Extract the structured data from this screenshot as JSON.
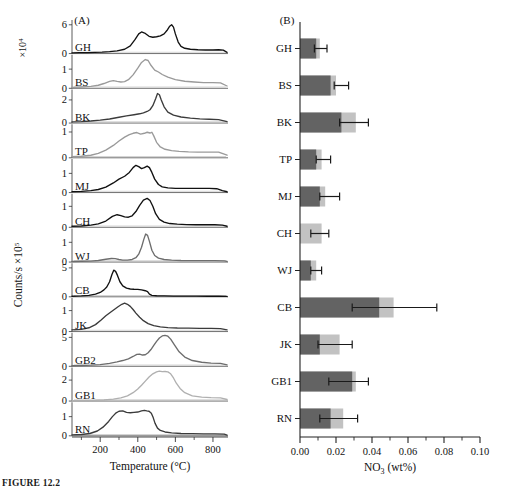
{
  "figure": {
    "caption": "FIGURE 12.2",
    "panel_a_label": "(A)",
    "panel_b_label": "(B)"
  },
  "chart_data": [
    {
      "type": "line",
      "title": "(A)",
      "xlabel": "Temperature (°C)",
      "ylabel": "Counts/s",
      "y_exponent_top": "×10",
      "y_exponent_top_sup": "4",
      "y_exponent_main": "×10",
      "y_exponent_main_sup": "5",
      "xlim": [
        50,
        880
      ],
      "xticks": [
        200,
        400,
        600,
        800
      ],
      "xtick_labels": [
        "200",
        "400",
        "600",
        "800"
      ],
      "xminor": [
        100,
        300,
        500,
        700
      ],
      "grid": false,
      "legend": "none",
      "note": "Twelve stacked thermal-evolution traces, one per sample; each sub-panel has its own y scale.",
      "series": [
        {
          "name": "GH",
          "color": "#121212",
          "ylim": [
            0,
            7
          ],
          "yticks": [
            0,
            6
          ],
          "ytick_labels": [
            "0",
            "6"
          ],
          "x": [
            50,
            90,
            130,
            170,
            210,
            250,
            290,
            330,
            360,
            385,
            405,
            420,
            440,
            460,
            480,
            500,
            520,
            540,
            555,
            570,
            580,
            590,
            600,
            615,
            630,
            650,
            680,
            720,
            760,
            800,
            830,
            855,
            875
          ],
          "y": [
            0.15,
            0.18,
            0.2,
            0.25,
            0.3,
            0.4,
            0.55,
            0.9,
            1.6,
            2.9,
            4.1,
            4.5,
            4.2,
            3.6,
            3.4,
            3.5,
            3.7,
            4.1,
            4.8,
            5.7,
            6.0,
            5.5,
            4.1,
            2.4,
            1.5,
            1.1,
            0.9,
            0.8,
            0.75,
            0.75,
            0.8,
            0.7,
            0.25
          ]
        },
        {
          "name": "BS",
          "color": "#9a9a9a",
          "ylim": [
            0,
            1.75
          ],
          "yticks": [
            0,
            1
          ],
          "ytick_labels": [
            "0",
            "1"
          ],
          "x": [
            50,
            100,
            150,
            190,
            220,
            250,
            270,
            290,
            310,
            330,
            350,
            375,
            400,
            420,
            440,
            455,
            470,
            490,
            510,
            530,
            560,
            600,
            650,
            700,
            750,
            800,
            840,
            875
          ],
          "y": [
            0.05,
            0.07,
            0.1,
            0.16,
            0.25,
            0.36,
            0.4,
            0.36,
            0.33,
            0.35,
            0.45,
            0.7,
            1.05,
            1.35,
            1.5,
            1.45,
            1.2,
            0.95,
            0.85,
            0.72,
            0.58,
            0.45,
            0.37,
            0.33,
            0.3,
            0.3,
            0.28,
            0.12
          ]
        },
        {
          "name": "BK",
          "color": "#3b3b3b",
          "ylim": [
            0,
            2.9
          ],
          "yticks": [
            0,
            2
          ],
          "ytick_labels": [
            "0",
            "2"
          ],
          "x": [
            50,
            100,
            150,
            200,
            250,
            300,
            340,
            380,
            410,
            430,
            450,
            465,
            480,
            495,
            505,
            515,
            525,
            540,
            560,
            590,
            630,
            680,
            730,
            780,
            830,
            875
          ],
          "y": [
            0.1,
            0.13,
            0.18,
            0.25,
            0.35,
            0.5,
            0.62,
            0.72,
            0.8,
            0.88,
            1.0,
            1.15,
            1.5,
            2.1,
            2.55,
            2.45,
            2.0,
            1.4,
            0.95,
            0.68,
            0.52,
            0.42,
            0.36,
            0.33,
            0.3,
            0.12
          ]
        },
        {
          "name": "TP",
          "color": "#9a9a9a",
          "ylim": [
            0,
            1.3
          ],
          "yticks": [
            0,
            1
          ],
          "ytick_labels": [
            "0",
            "1"
          ],
          "x": [
            50,
            100,
            150,
            190,
            230,
            270,
            300,
            330,
            355,
            375,
            395,
            415,
            435,
            450,
            465,
            475,
            485,
            500,
            520,
            545,
            580,
            620,
            670,
            720,
            780,
            830,
            875
          ],
          "y": [
            0.04,
            0.06,
            0.1,
            0.17,
            0.3,
            0.48,
            0.65,
            0.8,
            0.9,
            0.95,
            0.98,
            0.92,
            0.95,
            0.99,
            0.96,
            0.99,
            0.85,
            0.6,
            0.42,
            0.33,
            0.28,
            0.25,
            0.23,
            0.22,
            0.22,
            0.22,
            0.1
          ]
        },
        {
          "name": "MJ",
          "color": "#111111",
          "ylim": [
            0,
            1.75
          ],
          "yticks": [
            0,
            1
          ],
          "ytick_labels": [
            "0",
            "1"
          ],
          "x": [
            50,
            100,
            150,
            190,
            230,
            270,
            300,
            330,
            355,
            375,
            390,
            405,
            420,
            435,
            450,
            462,
            475,
            490,
            510,
            530,
            560,
            600,
            650,
            700,
            740,
            780,
            820,
            850,
            875
          ],
          "y": [
            0.05,
            0.06,
            0.1,
            0.16,
            0.28,
            0.5,
            0.7,
            0.85,
            1.05,
            1.3,
            1.42,
            1.35,
            1.25,
            1.3,
            1.38,
            1.3,
            1.05,
            0.7,
            0.42,
            0.3,
            0.24,
            0.22,
            0.22,
            0.22,
            0.22,
            0.22,
            0.2,
            0.1,
            0.04
          ]
        },
        {
          "name": "CH",
          "color": "#111111",
          "ylim": [
            0,
            1.6
          ],
          "yticks": [
            0,
            1
          ],
          "ytick_labels": [
            "0",
            "1"
          ],
          "x": [
            50,
            100,
            150,
            190,
            230,
            265,
            290,
            310,
            330,
            350,
            370,
            390,
            410,
            430,
            450,
            465,
            480,
            495,
            515,
            540,
            570,
            610,
            660,
            710,
            760,
            810,
            850,
            875
          ],
          "y": [
            0.05,
            0.06,
            0.1,
            0.16,
            0.3,
            0.52,
            0.6,
            0.56,
            0.5,
            0.48,
            0.55,
            0.75,
            1.05,
            1.3,
            1.38,
            1.28,
            1.0,
            0.65,
            0.38,
            0.25,
            0.18,
            0.15,
            0.13,
            0.12,
            0.12,
            0.12,
            0.1,
            0.05
          ]
        },
        {
          "name": "WJ",
          "color": "#6d6d6d",
          "ylim": [
            0,
            1.7
          ],
          "yticks": [
            0,
            1
          ],
          "ytick_labels": [
            "0",
            "1"
          ],
          "x": [
            50,
            100,
            150,
            190,
            230,
            260,
            280,
            300,
            320,
            345,
            370,
            390,
            405,
            420,
            432,
            442,
            452,
            462,
            475,
            490,
            510,
            540,
            580,
            630,
            690,
            750,
            810,
            860,
            875
          ],
          "y": [
            0.03,
            0.04,
            0.05,
            0.08,
            0.14,
            0.18,
            0.17,
            0.13,
            0.1,
            0.1,
            0.13,
            0.22,
            0.4,
            0.75,
            1.15,
            1.42,
            1.35,
            1.05,
            0.6,
            0.33,
            0.2,
            0.13,
            0.1,
            0.08,
            0.07,
            0.07,
            0.07,
            0.06,
            0.03
          ]
        },
        {
          "name": "CB",
          "color": "#111111",
          "ylim": [
            0,
            5.8
          ],
          "yticks": [
            0,
            5
          ],
          "ytick_labels": [
            "0",
            "5"
          ],
          "x": [
            50,
            100,
            140,
            175,
            200,
            220,
            235,
            250,
            262,
            272,
            282,
            292,
            305,
            320,
            340,
            360,
            380,
            400,
            420,
            440,
            452,
            462,
            475,
            500,
            540,
            590,
            650,
            710,
            770,
            830,
            875
          ],
          "y": [
            0.1,
            0.15,
            0.25,
            0.45,
            0.75,
            1.2,
            1.7,
            2.6,
            3.8,
            4.6,
            4.4,
            3.7,
            2.6,
            1.9,
            1.5,
            1.35,
            1.3,
            1.28,
            1.2,
            1.05,
            0.9,
            0.45,
            0.25,
            0.18,
            0.15,
            0.13,
            0.12,
            0.11,
            0.1,
            0.1,
            0.06
          ]
        },
        {
          "name": "JK",
          "color": "#3b3b3b",
          "ylim": [
            0,
            1.6
          ],
          "yticks": [
            0,
            1
          ],
          "ytick_labels": [
            "0",
            "1"
          ],
          "x": [
            50,
            100,
            140,
            175,
            205,
            230,
            255,
            275,
            295,
            315,
            330,
            345,
            360,
            375,
            390,
            410,
            430,
            455,
            485,
            520,
            560,
            610,
            670,
            730,
            790,
            840,
            875
          ],
          "y": [
            0.08,
            0.1,
            0.18,
            0.33,
            0.55,
            0.75,
            0.92,
            1.05,
            1.18,
            1.3,
            1.35,
            1.3,
            1.2,
            1.05,
            0.88,
            0.68,
            0.52,
            0.38,
            0.28,
            0.22,
            0.19,
            0.17,
            0.16,
            0.15,
            0.15,
            0.14,
            0.08
          ]
        },
        {
          "name": "GB2",
          "color": "#6d6d6d",
          "ylim": [
            0,
            5.8
          ],
          "yticks": [
            0,
            5
          ],
          "ytick_labels": [
            "0",
            "5"
          ],
          "x": [
            50,
            100,
            150,
            200,
            250,
            290,
            320,
            350,
            375,
            395,
            410,
            425,
            440,
            455,
            470,
            485,
            500,
            515,
            530,
            545,
            560,
            575,
            595,
            620,
            650,
            690,
            740,
            790,
            840,
            875
          ],
          "y": [
            0.1,
            0.14,
            0.2,
            0.3,
            0.5,
            0.75,
            1.0,
            1.3,
            1.7,
            2.05,
            2.1,
            1.95,
            2.0,
            2.35,
            2.9,
            3.6,
            4.3,
            4.9,
            5.25,
            5.35,
            5.2,
            4.7,
            3.7,
            2.5,
            1.6,
            1.0,
            0.7,
            0.55,
            0.5,
            0.25
          ]
        },
        {
          "name": "GB1",
          "color": "#b0b0b0",
          "ylim": [
            0,
            3.2
          ],
          "yticks": [
            0,
            2
          ],
          "ytick_labels": [
            "0",
            "2"
          ],
          "x": [
            50,
            110,
            170,
            220,
            270,
            310,
            345,
            375,
            400,
            420,
            440,
            460,
            480,
            500,
            515,
            530,
            545,
            560,
            575,
            590,
            605,
            625,
            650,
            690,
            740,
            790,
            840,
            875
          ],
          "y": [
            0.03,
            0.04,
            0.06,
            0.1,
            0.18,
            0.3,
            0.5,
            0.8,
            1.15,
            1.5,
            1.9,
            2.3,
            2.6,
            2.78,
            2.85,
            2.8,
            2.82,
            2.78,
            2.6,
            2.2,
            1.7,
            1.2,
            0.8,
            0.5,
            0.38,
            0.33,
            0.3,
            0.15
          ]
        },
        {
          "name": "RN",
          "color": "#3b3b3b",
          "ylim": [
            0,
            1.75
          ],
          "yticks": [
            0,
            1
          ],
          "ytick_labels": [
            "0",
            "1"
          ],
          "x": [
            50,
            100,
            145,
            185,
            215,
            245,
            265,
            285,
            300,
            320,
            340,
            360,
            380,
            400,
            420,
            435,
            448,
            460,
            472,
            482,
            492,
            505,
            520,
            545,
            580,
            630,
            690,
            750,
            810,
            860,
            875
          ],
          "y": [
            0.05,
            0.07,
            0.12,
            0.25,
            0.45,
            0.75,
            1.0,
            1.2,
            1.28,
            1.3,
            1.22,
            1.2,
            1.22,
            1.24,
            1.3,
            1.33,
            1.3,
            1.28,
            1.18,
            0.95,
            0.65,
            0.4,
            0.28,
            0.2,
            0.15,
            0.12,
            0.11,
            0.1,
            0.1,
            0.09,
            0.04
          ]
        }
      ]
    },
    {
      "type": "bar",
      "orientation": "horizontal",
      "title": "(B)",
      "xlabel": "NO₃ (wt%)",
      "xlabel_base": "NO",
      "xlabel_sub": "3",
      "xlabel_rest": " (wt%)",
      "ylabel": "",
      "xlim": [
        0,
        0.1
      ],
      "xticks": [
        0.0,
        0.02,
        0.04,
        0.06,
        0.08,
        0.1
      ],
      "xtick_labels": [
        "0.00",
        "0.02",
        "0.04",
        "0.06",
        "0.08",
        "0.10"
      ],
      "xminor": [
        0.01,
        0.03,
        0.05,
        0.07,
        0.09
      ],
      "grid": false,
      "legend": "none",
      "colors": {
        "dark_segment": "#636363",
        "light_segment": "#c2c2c2",
        "errorbar": "#1a1a1a"
      },
      "categories": [
        "GH",
        "BS",
        "BK",
        "TP",
        "MJ",
        "CH",
        "WJ",
        "CB",
        "JK",
        "GB1",
        "RN"
      ],
      "series": [
        {
          "name": "dark",
          "values": [
            0.009,
            0.017,
            0.023,
            0.009,
            0.011,
            0.0,
            0.006,
            0.044,
            0.011,
            0.029,
            0.017
          ]
        },
        {
          "name": "light_total",
          "values": [
            0.011,
            0.02,
            0.031,
            0.012,
            0.014,
            0.012,
            0.009,
            0.052,
            0.022,
            0.031,
            0.024
          ]
        }
      ],
      "error_bars": [
        {
          "category": "GH",
          "low": 0.008,
          "high": 0.015
        },
        {
          "category": "BS",
          "low": 0.019,
          "high": 0.027
        },
        {
          "category": "BK",
          "low": 0.022,
          "high": 0.038
        },
        {
          "category": "TP",
          "low": 0.009,
          "high": 0.017
        },
        {
          "category": "MJ",
          "low": 0.011,
          "high": 0.022
        },
        {
          "category": "CH",
          "low": 0.006,
          "high": 0.016
        },
        {
          "category": "WJ",
          "low": 0.006,
          "high": 0.012
        },
        {
          "category": "CB",
          "low": 0.029,
          "high": 0.076
        },
        {
          "category": "JK",
          "low": 0.01,
          "high": 0.029
        },
        {
          "category": "GB1",
          "low": 0.016,
          "high": 0.038
        },
        {
          "category": "RN",
          "low": 0.011,
          "high": 0.032
        }
      ]
    }
  ]
}
